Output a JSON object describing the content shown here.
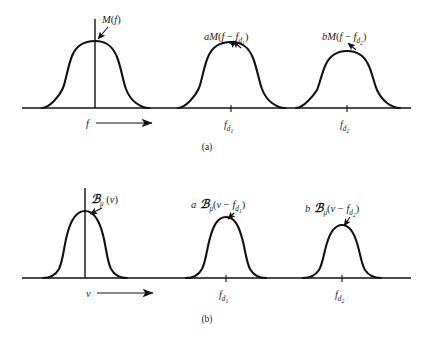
{
  "figure": {
    "background": "#ffffff",
    "ink_color": "#111111",
    "panels": [
      {
        "id": "a",
        "caption": "(a)",
        "axis_label": "f",
        "axis_arrow": "⟶",
        "ticks": [
          {
            "label_main": "f",
            "label_sub": "d",
            "label_subsub": "1"
          },
          {
            "label_main": "f",
            "label_sub": "d",
            "label_subsub": "2"
          }
        ],
        "curve_labels": [
          {
            "text": "M(f)",
            "parts": {
              "coef": "",
              "func": "M",
              "open": "(",
              "arg": "f",
              "close": ")"
            }
          },
          {
            "text": "aM(f − f_d₁)",
            "parts": {
              "coef": "a",
              "func": "M",
              "open": "(",
              "arg": "f − f",
              "sub": "d",
              "subsub": "1",
              "close": ")"
            }
          },
          {
            "text": "bM(f − f_d₂)",
            "parts": {
              "coef": "b",
              "func": "M",
              "open": "(",
              "arg": "f − f",
              "sub": "d",
              "subsub": "2",
              "close": ")"
            }
          }
        ]
      },
      {
        "id": "b",
        "caption": "(b)",
        "axis_label": "ν",
        "axis_arrow": "⟶",
        "ticks": [
          {
            "label_main": "f",
            "label_sub": "d",
            "label_subsub": "1"
          },
          {
            "label_main": "f",
            "label_sub": "d",
            "label_subsub": "2"
          }
        ],
        "curve_labels": [
          {
            "text": "ℬμ(ν)",
            "parts": {
              "coef": "",
              "func": "ހ",
              "sub": "μ",
              "open": "(",
              "arg": "ν",
              "close": ")"
            }
          },
          {
            "text": "a ℬμ(ν − f_d₁)",
            "parts": {
              "coef": "a",
              "func": "ހ",
              "sub": "μ",
              "open": "(",
              "arg": "ν − f",
              "sub2": "d",
              "subsub": "1",
              "close": ")"
            }
          },
          {
            "text": "b ℬμ(ν − f_d₂)",
            "parts": {
              "coef": "b",
              "func": "ހ",
              "sub": "μ",
              "open": "(",
              "arg": "ν − f",
              "sub2": "d",
              "subsub": "2",
              "close": ")"
            }
          }
        ]
      }
    ],
    "glyphs": {
      "script_k": "ℬ",
      "mu": "μ",
      "nu": "ν",
      "minus": "−",
      "rightarrow": "⟶"
    }
  }
}
